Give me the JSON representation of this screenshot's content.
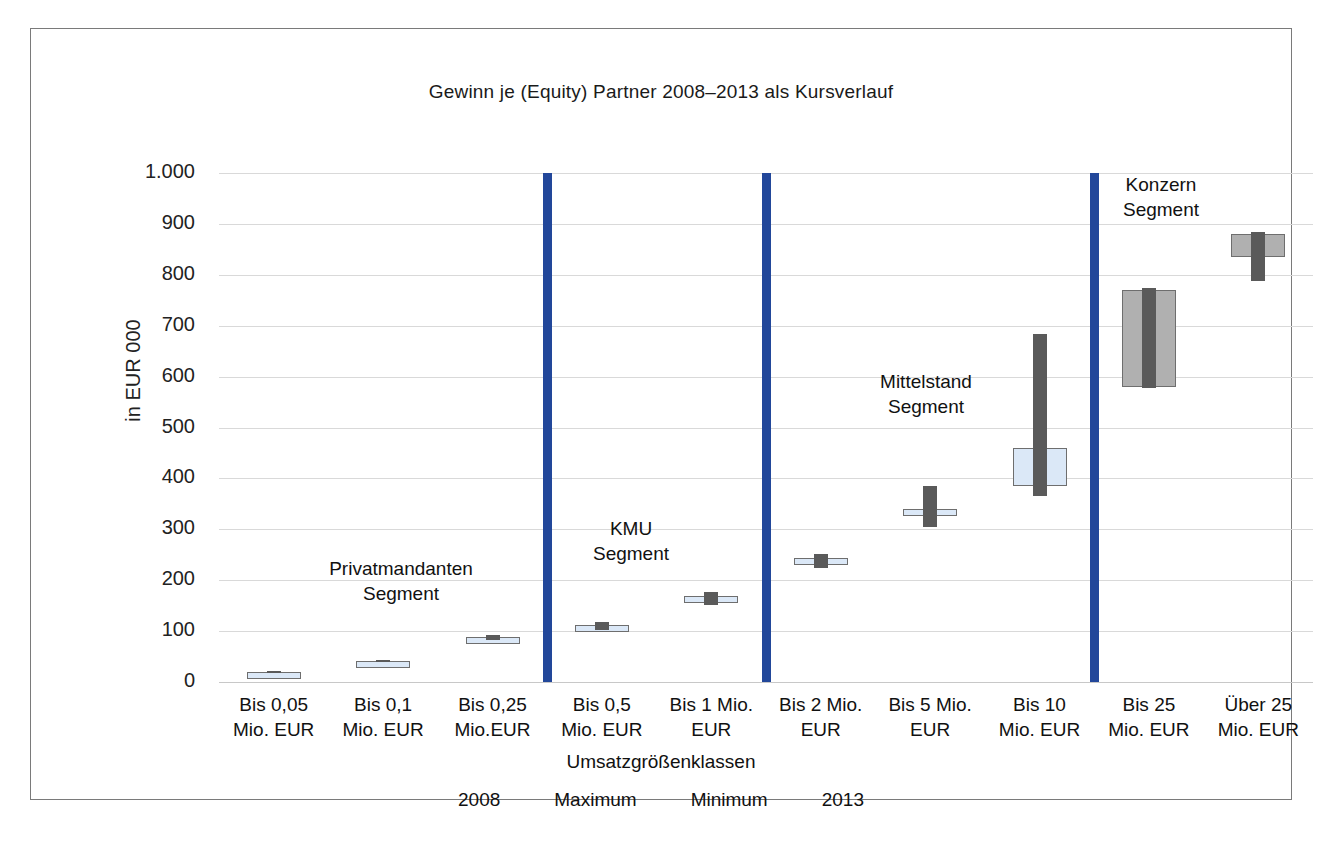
{
  "chart_data": {
    "type": "bar",
    "title": "Gewinn je (Equity) Partner 2008–2013 als Kursverlauf",
    "xlabel": "Umsatzgrößenklassen",
    "ylabel": "in EUR 000",
    "ylim": [
      0,
      1000
    ],
    "ytick_labels": [
      "1.000",
      "900",
      "800",
      "700",
      "600",
      "500",
      "400",
      "300",
      "200",
      "100",
      "0"
    ],
    "ytick_values": [
      1000,
      900,
      800,
      700,
      600,
      500,
      400,
      300,
      200,
      100,
      0
    ],
    "grid": true,
    "legend_position": "bottom",
    "legend": [
      "2008",
      "Maximum",
      "Minimum",
      "2013"
    ],
    "categories": [
      "Bis 0,05 Mio. EUR",
      "Bis 0,1 Mio. EUR",
      "Bis 0,25 Mio.EUR",
      "Bis 0,5 Mio. EUR",
      "Bis 1 Mio. EUR",
      "Bis 2 Mio. EUR",
      "Bis 5 Mio. EUR",
      "Bis 10 Mio. EUR",
      "Bis 25 Mio. EUR",
      "Über 25 Mio. EUR"
    ],
    "category_lines": [
      [
        "Bis 0,05",
        "Mio. EUR"
      ],
      [
        "Bis 0,1",
        "Mio. EUR"
      ],
      [
        "Bis 0,25",
        "Mio.EUR"
      ],
      [
        "Bis 0,5",
        "Mio. EUR"
      ],
      [
        "Bis 1 Mio.",
        "EUR"
      ],
      [
        "Bis 2 Mio.",
        "EUR"
      ],
      [
        "Bis 5 Mio.",
        "EUR"
      ],
      [
        "Bis 10",
        "Mio. EUR"
      ],
      [
        "Bis 25",
        "Mio. EUR"
      ],
      [
        "Über 25",
        "Mio. EUR"
      ]
    ],
    "series": [
      {
        "name": "2008",
        "values": [
          20,
          42,
          84,
          108,
          158,
          236,
          332,
          385,
          580,
          835
        ]
      },
      {
        "name": "2013",
        "values": [
          20,
          42,
          88,
          112,
          168,
          244,
          340,
          460,
          770,
          880
        ]
      },
      {
        "name": "Maximum",
        "values": [
          22,
          44,
          92,
          118,
          176,
          252,
          385,
          683,
          775,
          885
        ]
      },
      {
        "name": "Minimum",
        "values": [
          18,
          40,
          82,
          103,
          152,
          224,
          305,
          365,
          578,
          788
        ]
      }
    ],
    "boxes": [
      {
        "category": "Bis 0,05 Mio. EUR",
        "low": 18,
        "high": 22,
        "open": 20,
        "close": 20,
        "fill": "blue"
      },
      {
        "category": "Bis 0,1 Mio. EUR",
        "low": 40,
        "high": 44,
        "open": 42,
        "close": 42,
        "fill": "blue"
      },
      {
        "category": "Bis 0,25 Mio.EUR",
        "low": 82,
        "high": 92,
        "open": 84,
        "close": 88,
        "fill": "blue"
      },
      {
        "category": "Bis 0,5 Mio. EUR",
        "low": 103,
        "high": 118,
        "open": 108,
        "close": 112,
        "fill": "blue"
      },
      {
        "category": "Bis 1 Mio. EUR",
        "low": 152,
        "high": 176,
        "open": 158,
        "close": 168,
        "fill": "blue"
      },
      {
        "category": "Bis 2 Mio. EUR",
        "low": 224,
        "high": 252,
        "open": 236,
        "close": 244,
        "fill": "blue"
      },
      {
        "category": "Bis 5 Mio. EUR",
        "low": 305,
        "high": 385,
        "open": 332,
        "close": 340,
        "fill": "blue"
      },
      {
        "category": "Bis 10 Mio. EUR",
        "low": 365,
        "high": 683,
        "open": 385,
        "close": 460,
        "fill": "blue"
      },
      {
        "category": "Bis 25 Mio. EUR",
        "low": 578,
        "high": 775,
        "open": 580,
        "close": 770,
        "fill": "gray"
      },
      {
        "category": "Über 25 Mio. EUR",
        "low": 788,
        "high": 885,
        "open": 835,
        "close": 880,
        "fill": "gray"
      }
    ],
    "segment_annotations": [
      {
        "name": "Privatmandanten Segment",
        "line1": "Privatmandanten",
        "line2": "Segment"
      },
      {
        "name": "KMU Segment",
        "line1": "KMU",
        "line2": "Segment"
      },
      {
        "name": "Mittelstand Segment",
        "line1": "Mittelstand",
        "line2": "Segment"
      },
      {
        "name": "Konzern Segment",
        "line1": "Konzern",
        "line2": "Segment"
      }
    ],
    "segment_dividers": [
      3,
      5,
      8
    ],
    "colors": {
      "divider": "#22479a",
      "box_blue": "#dbe8f7",
      "box_gray": "#b0b0b0",
      "wick": "#5a5a5a",
      "grid": "#d9d9d9"
    }
  }
}
